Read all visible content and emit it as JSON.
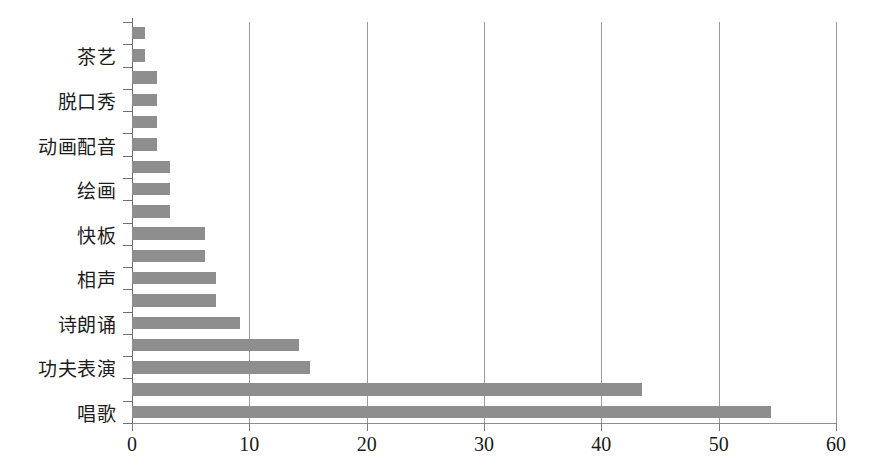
{
  "chart_data": {
    "type": "bar",
    "orientation": "horizontal",
    "title": "",
    "xlabel": "",
    "ylabel": "",
    "xlim": [
      0,
      60
    ],
    "xticks": [
      0,
      10,
      20,
      30,
      40,
      50,
      60
    ],
    "xtick_labels": [
      "0",
      "10",
      "20",
      "30",
      "40",
      "50",
      "60"
    ],
    "grid": "vertical",
    "legend": "none",
    "bar_color": "#8e8e8e",
    "axis_color": "#8d8d8d",
    "gridline_color": "#9a9a9a",
    "label_interval": 2,
    "categories": [
      "",
      "茶艺",
      "",
      "脱口秀",
      "",
      "动画配音",
      "",
      "绘画",
      "",
      "快板",
      "",
      "相声",
      "",
      "诗朗诵",
      "",
      "功夫表演",
      "",
      "唱歌"
    ],
    "visible_category_labels": [
      "茶艺",
      "脱口秀",
      "动画配音",
      "绘画",
      "快板",
      "相声",
      "诗朗诵",
      "功夫表演",
      "唱歌"
    ],
    "values": [
      1.1,
      1.1,
      2.1,
      2.1,
      2.1,
      2.1,
      3.2,
      3.2,
      3.2,
      6.2,
      6.2,
      7.2,
      7.2,
      9.2,
      14.2,
      15.2,
      43.5,
      54.5
    ]
  }
}
